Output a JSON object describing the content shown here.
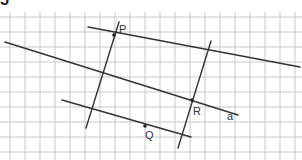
{
  "exercise": {
    "number": "5"
  },
  "grid": {
    "spacing": 15,
    "x_start": 10,
    "y_start": 17,
    "color": "#c8c8c8",
    "x_min": 0,
    "x_max": 302,
    "y_min": 12,
    "y_max": 160
  },
  "colors": {
    "line": "#333333",
    "point": "#222222",
    "label": "#333333",
    "background": "#ffffff"
  },
  "lines": [
    {
      "name": "line-a",
      "x1": 5,
      "y1": 42,
      "x2": 238,
      "y2": 115
    },
    {
      "name": "line-through-p-parallel-a",
      "x1": 88,
      "y1": 27,
      "x2": 300,
      "y2": 67
    },
    {
      "name": "line-through-q-parallel-a",
      "x1": 62,
      "y1": 100,
      "x2": 191,
      "y2": 137
    },
    {
      "name": "line-through-p-transversal",
      "x1": 119,
      "y1": 22,
      "x2": 86,
      "y2": 128
    },
    {
      "name": "line-through-r-transversal",
      "x1": 211,
      "y1": 41,
      "x2": 178,
      "y2": 148
    }
  ],
  "points": [
    {
      "name": "P",
      "x": 114,
      "y": 35,
      "label_x": 119,
      "label_y": 33
    },
    {
      "name": "R",
      "x": 192,
      "y": 100,
      "label_x": 193,
      "label_y": 115
    },
    {
      "name": "Q",
      "x": 145,
      "y": 126,
      "label_x": 145,
      "label_y": 139
    }
  ],
  "line_labels": [
    {
      "name": "a",
      "x": 227,
      "y": 120
    }
  ]
}
